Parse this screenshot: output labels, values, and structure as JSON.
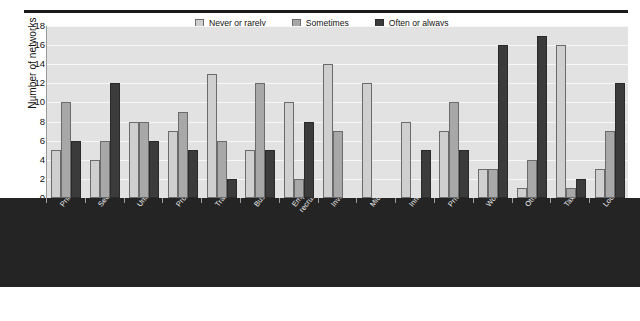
{
  "chart_data": {
    "type": "bar",
    "title": "",
    "subtitle": "",
    "xlabel": "",
    "ylabel": "Number of networks",
    "ylim": [
      0,
      18
    ],
    "ytick_step": 2,
    "yticks": [
      "18",
      "16",
      "14",
      "12",
      "10",
      "8",
      "6",
      "4",
      "2",
      "0"
    ],
    "grid": true,
    "legend_position": "top-center",
    "categories": [
      "Primary schools",
      "Secondary schools",
      "Universities",
      "Professional associations",
      "Trade promotion agencies",
      "Business supporting org.",
      "Employment office / recruitment agency",
      "Investment promotion agencies",
      "Micro-credit org. / banks",
      "Innovation / R&D org.",
      "Private co.",
      "Women org.",
      "Other social org.",
      "Tax office",
      "Local / regional government"
    ],
    "category_lines": [
      [
        "Primary schools"
      ],
      [
        "Secondary schools"
      ],
      [
        "Universities"
      ],
      [
        "Professional associations"
      ],
      [
        "Trade promotion agencies"
      ],
      [
        "Business supporting org."
      ],
      [
        "Employment office /",
        "recruitment agency"
      ],
      [
        "Investment promotion agencies"
      ],
      [
        "Micro-credit org. / banks"
      ],
      [
        "Innovation / R&D org."
      ],
      [
        "Private co."
      ],
      [
        "Women org."
      ],
      [
        "Other social org."
      ],
      [
        "Tax office"
      ],
      [
        "Local / regional government"
      ]
    ],
    "series": [
      {
        "name": "Never or rarely",
        "color": "#cfcfcf",
        "values": [
          5,
          4,
          8,
          7,
          13,
          5,
          10,
          14,
          12,
          8,
          7,
          3,
          1,
          16,
          3
        ]
      },
      {
        "name": "Sometimes",
        "color": "#a8a8a8",
        "values": [
          10,
          6,
          8,
          9,
          6,
          12,
          2,
          7,
          0,
          0,
          10,
          3,
          4,
          1,
          7
        ]
      },
      {
        "name": "Often or always",
        "color": "#3b3b3b",
        "values": [
          6,
          12,
          6,
          5,
          2,
          5,
          8,
          0,
          0,
          5,
          5,
          16,
          17,
          2,
          12
        ]
      }
    ]
  },
  "legend": {
    "items": [
      {
        "label": "Never or rarely"
      },
      {
        "label": "Sometimes"
      },
      {
        "label": "Often or always"
      }
    ]
  }
}
